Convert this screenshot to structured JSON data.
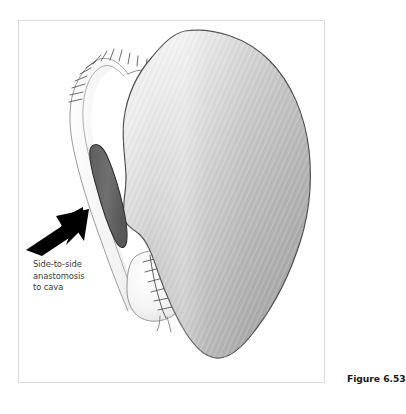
{
  "figure": {
    "caption": "Figure 6.53",
    "callout": {
      "lines": [
        "Side-to-side",
        "anastomosis",
        "to cava"
      ]
    },
    "colors": {
      "organ_fill_light": "#f2f2f2",
      "organ_fill_mid": "#c0c0c0",
      "organ_fill_dark": "#a8a8a8",
      "organ_outline": "#4a4a4a",
      "anastomosis_fill": "#6d6d6d",
      "anastomosis_outline": "#2f2f2f",
      "lobe_fill": "#f6f6f6",
      "graft_outline": "#8a8a8a",
      "suture_stroke": "#4f4f4f",
      "arrow_fill": "#000000",
      "frame_border": "#dcdcdc",
      "label_text": "#3b3b3b",
      "caption_text": "#1a1a1a",
      "background": "#ffffff"
    },
    "parts": [
      {
        "name": "liver",
        "label": "liver body"
      },
      {
        "name": "graft-outline",
        "label": "sutured graft outline"
      },
      {
        "name": "anastomosis",
        "label": "side-to-side anastomosis to cava"
      },
      {
        "name": "caudate-lobe",
        "label": "sutured lobe"
      },
      {
        "name": "pointer-arrow",
        "label": "arrow indicating anastomosis"
      }
    ]
  }
}
